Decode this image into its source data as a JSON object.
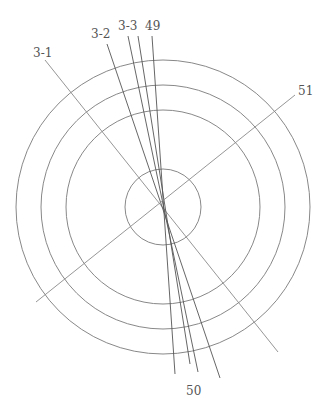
{
  "diagram": {
    "center": {
      "x": 163,
      "y": 207
    },
    "circles": [
      {
        "name": "outer-ring",
        "r": 147
      },
      {
        "name": "middle-ring",
        "r": 122
      },
      {
        "name": "inner-ring",
        "r": 97
      },
      {
        "name": "core-circle",
        "r": 38
      }
    ],
    "lines": [
      {
        "id": "3-1",
        "x1": 45,
        "y1": 60,
        "x2": 278,
        "y2": 352
      },
      {
        "id": "3-2",
        "x1": 107,
        "y1": 44,
        "x2": 220,
        "y2": 378
      },
      {
        "id": "3-3a",
        "x1": 128,
        "y1": 36,
        "x2": 198,
        "y2": 372
      },
      {
        "id": "3-3b",
        "x1": 138,
        "y1": 36,
        "x2": 190,
        "y2": 364
      },
      {
        "id": "49",
        "x1": 152,
        "y1": 36,
        "x2": 175,
        "y2": 374
      },
      {
        "id": "51",
        "x1": 295,
        "y1": 95,
        "x2": 36,
        "y2": 302
      }
    ],
    "labels": [
      {
        "text": "3-1",
        "x": 33,
        "y": 57
      },
      {
        "text": "3-2",
        "x": 91,
        "y": 38
      },
      {
        "text": "3-3",
        "x": 118,
        "y": 30
      },
      {
        "text": "49",
        "x": 145,
        "y": 30
      },
      {
        "text": "51",
        "x": 298,
        "y": 95
      },
      {
        "text": "50",
        "x": 186,
        "y": 395
      }
    ]
  }
}
